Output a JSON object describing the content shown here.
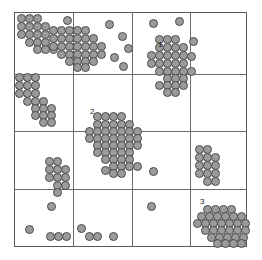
{
  "figure": {
    "kind": "scatter-plot-with-grid",
    "background_color": "#ffffff",
    "border_color": "#5a5a5a",
    "gridline_color": "#6b6b6b",
    "point_fill_color": "#9b9b9b",
    "point_stroke_color": "#4a4a4a",
    "point_diameter_px": 9
  },
  "chart_data": {
    "type": "scatter",
    "title": "",
    "subtitle": "",
    "xlabel": "",
    "ylabel": "",
    "xlim": [
      0,
      100
    ],
    "ylim": [
      0,
      100
    ],
    "xticks": [],
    "yticks": [],
    "xtick_labels": [],
    "ytick_labels": [],
    "grid": true,
    "grid_rows": 4,
    "grid_columns": 4,
    "grid_x_lines": [
      25,
      50,
      75
    ],
    "grid_y_lines": [
      25,
      50,
      75
    ],
    "legend": null,
    "legend_position": "none",
    "series": [
      {
        "name": "points",
        "marker": "circle",
        "fill": "#9b9b9b",
        "stroke": "#4a4a4a",
        "x": [
          9,
          14,
          20,
          9,
          14,
          20,
          26,
          9,
          14,
          20,
          26,
          14,
          20,
          26,
          20,
          26,
          31,
          26,
          31,
          37,
          42,
          48,
          31,
          37,
          42,
          48,
          54,
          31,
          37,
          42,
          48,
          54,
          37,
          42,
          48,
          54,
          42,
          48,
          54,
          37,
          42,
          48,
          58,
          27,
          55,
          62,
          70,
          57,
          65,
          77,
          86,
          8,
          14,
          20,
          8,
          14,
          20,
          8,
          14,
          20,
          14,
          20,
          26,
          20,
          26,
          32,
          20,
          26,
          32,
          26,
          32,
          63,
          69,
          75,
          63,
          69,
          75,
          81,
          63,
          69,
          75,
          81,
          87,
          63,
          69,
          75,
          81,
          87,
          69,
          75,
          81,
          87,
          93,
          75,
          81,
          87,
          69,
          75,
          81,
          87,
          75,
          81,
          93,
          97,
          88,
          97,
          41,
          47,
          53,
          59,
          41,
          47,
          53,
          59,
          65,
          35,
          41,
          47,
          53,
          59,
          65,
          71,
          35,
          41,
          47,
          53,
          59,
          65,
          71,
          41,
          47,
          53,
          59,
          65,
          71,
          41,
          47,
          53,
          59,
          65,
          47,
          53,
          59,
          65,
          53,
          59,
          65,
          71,
          53,
          59,
          47,
          78,
          84,
          78,
          84,
          90,
          78,
          84,
          90,
          78,
          84,
          90,
          84,
          90,
          19,
          25,
          19,
          25,
          31,
          19,
          25,
          31,
          25,
          31,
          25,
          20,
          63,
          5,
          20,
          26,
          32,
          20,
          26,
          42,
          48,
          60,
          42,
          48,
          79,
          85,
          91,
          97,
          73,
          79,
          85,
          91,
          97,
          103,
          67,
          73,
          79,
          85,
          91,
          97,
          103,
          73,
          79,
          85,
          91,
          97,
          103,
          79,
          85,
          91,
          97,
          103,
          85,
          91,
          97,
          103,
          91,
          97,
          103
        ],
        "y": [
          96,
          96,
          96,
          91,
          91,
          91,
          91,
          86,
          86,
          86,
          86,
          81,
          81,
          81,
          76,
          76,
          76,
          89,
          89,
          89,
          89,
          89,
          84,
          84,
          84,
          84,
          84,
          79,
          79,
          79,
          79,
          79,
          74,
          74,
          74,
          74,
          69,
          69,
          69,
          64,
          64,
          64,
          74,
          93,
          94,
          79,
          73,
          68,
          63,
          94,
          88,
          70,
          70,
          70,
          65,
          65,
          65,
          60,
          60,
          60,
          55,
          55,
          55,
          50,
          50,
          50,
          45,
          45,
          45,
          40,
          40,
          88,
          88,
          88,
          83,
          83,
          83,
          83,
          78,
          78,
          78,
          78,
          78,
          73,
          73,
          73,
          73,
          73,
          68,
          68,
          68,
          68,
          68,
          63,
          63,
          63,
          58,
          58,
          58,
          58,
          53,
          53,
          81,
          86,
          78,
          66,
          60,
          60,
          60,
          60,
          55,
          55,
          55,
          55,
          55,
          50,
          50,
          50,
          50,
          50,
          50,
          50,
          45,
          45,
          45,
          45,
          45,
          45,
          45,
          40,
          40,
          40,
          40,
          40,
          40,
          35,
          35,
          35,
          35,
          35,
          30,
          30,
          30,
          30,
          25,
          25,
          25,
          25,
          20,
          20,
          22,
          40,
          40,
          35,
          35,
          35,
          30,
          30,
          30,
          25,
          25,
          25,
          20,
          20,
          30,
          30,
          25,
          25,
          25,
          20,
          20,
          20,
          15,
          15,
          10,
          3,
          27,
          3,
          3,
          3,
          3,
          8,
          8,
          3,
          3,
          5,
          8,
          8,
          17,
          17,
          17,
          17,
          12,
          12,
          12,
          12,
          12,
          12,
          7,
          7,
          7,
          7,
          7,
          7,
          7,
          2,
          2,
          2,
          2,
          2,
          2,
          -2,
          -2,
          -2,
          -2,
          -2,
          -6,
          -6,
          -6,
          -6,
          -10,
          -10,
          -10
        ]
      }
    ],
    "annotations": [
      {
        "text": "1",
        "x": 62,
        "y": 82,
        "label": "cluster-1-label"
      },
      {
        "text": "2",
        "x": 35,
        "y": 57,
        "label": "cluster-2-label"
      },
      {
        "text": "3",
        "x": 78,
        "y": 20,
        "label": "cluster-3-label"
      }
    ]
  },
  "points": {
    "top_left_dense": [
      [
        20,
        17
      ],
      [
        28,
        17
      ],
      [
        36,
        17
      ],
      [
        20,
        25
      ],
      [
        28,
        25
      ],
      [
        36,
        25
      ],
      [
        44,
        25
      ],
      [
        20,
        33
      ],
      [
        28,
        33
      ],
      [
        36,
        33
      ],
      [
        44,
        33
      ],
      [
        28,
        41
      ],
      [
        36,
        41
      ],
      [
        44,
        41
      ],
      [
        36,
        48
      ],
      [
        44,
        48
      ],
      [
        52,
        48
      ]
    ],
    "upper_middle_band": [
      [
        52,
        29
      ],
      [
        60,
        29
      ],
      [
        68,
        29
      ],
      [
        76,
        29
      ],
      [
        84,
        29
      ],
      [
        52,
        37
      ],
      [
        60,
        37
      ],
      [
        68,
        37
      ],
      [
        76,
        37
      ],
      [
        84,
        37
      ],
      [
        92,
        37
      ],
      [
        52,
        45
      ],
      [
        60,
        45
      ],
      [
        68,
        45
      ],
      [
        76,
        45
      ],
      [
        84,
        45
      ],
      [
        92,
        45
      ],
      [
        60,
        53
      ],
      [
        68,
        53
      ],
      [
        76,
        53
      ],
      [
        84,
        53
      ],
      [
        92,
        53
      ],
      [
        68,
        60
      ],
      [
        76,
        60
      ],
      [
        84,
        60
      ],
      [
        92,
        60
      ],
      [
        76,
        66
      ],
      [
        84,
        66
      ],
      [
        100,
        45
      ],
      [
        100,
        53
      ]
    ],
    "scattered_upper": [
      [
        66,
        19
      ],
      [
        108,
        23
      ],
      [
        121,
        35
      ],
      [
        127,
        47
      ],
      [
        113,
        56
      ],
      [
        122,
        65
      ],
      [
        152,
        22
      ],
      [
        178,
        20
      ],
      [
        192,
        40
      ]
    ],
    "left_middle_cluster": [
      [
        18,
        76
      ],
      [
        26,
        76
      ],
      [
        34,
        76
      ],
      [
        18,
        84
      ],
      [
        26,
        84
      ],
      [
        34,
        84
      ],
      [
        18,
        92
      ],
      [
        26,
        92
      ],
      [
        34,
        92
      ],
      [
        26,
        100
      ],
      [
        34,
        100
      ],
      [
        42,
        100
      ],
      [
        34,
        107
      ],
      [
        42,
        107
      ],
      [
        50,
        107
      ],
      [
        34,
        114
      ],
      [
        42,
        114
      ],
      [
        50,
        114
      ],
      [
        42,
        121
      ],
      [
        50,
        121
      ]
    ],
    "cluster1": [
      [
        158,
        38
      ],
      [
        166,
        38
      ],
      [
        174,
        38
      ],
      [
        158,
        46
      ],
      [
        166,
        46
      ],
      [
        174,
        46
      ],
      [
        182,
        46
      ],
      [
        150,
        54
      ],
      [
        158,
        54
      ],
      [
        166,
        54
      ],
      [
        174,
        54
      ],
      [
        182,
        54
      ],
      [
        150,
        62
      ],
      [
        158,
        62
      ],
      [
        166,
        62
      ],
      [
        174,
        62
      ],
      [
        182,
        62
      ],
      [
        158,
        70
      ],
      [
        166,
        70
      ],
      [
        174,
        70
      ],
      [
        182,
        70
      ],
      [
        190,
        70
      ],
      [
        166,
        77
      ],
      [
        174,
        77
      ],
      [
        182,
        77
      ],
      [
        158,
        84
      ],
      [
        166,
        84
      ],
      [
        174,
        84
      ],
      [
        182,
        84
      ],
      [
        166,
        91
      ],
      [
        174,
        91
      ],
      [
        190,
        55
      ]
    ],
    "cluster2": [
      [
        96,
        115
      ],
      [
        104,
        115
      ],
      [
        112,
        115
      ],
      [
        120,
        115
      ],
      [
        96,
        123
      ],
      [
        104,
        123
      ],
      [
        112,
        123
      ],
      [
        120,
        123
      ],
      [
        128,
        123
      ],
      [
        88,
        130
      ],
      [
        96,
        130
      ],
      [
        104,
        130
      ],
      [
        112,
        130
      ],
      [
        120,
        130
      ],
      [
        128,
        130
      ],
      [
        136,
        130
      ],
      [
        88,
        137
      ],
      [
        96,
        137
      ],
      [
        104,
        137
      ],
      [
        112,
        137
      ],
      [
        120,
        137
      ],
      [
        128,
        137
      ],
      [
        136,
        137
      ],
      [
        96,
        144
      ],
      [
        104,
        144
      ],
      [
        112,
        144
      ],
      [
        120,
        144
      ],
      [
        128,
        144
      ],
      [
        136,
        144
      ],
      [
        96,
        151
      ],
      [
        104,
        151
      ],
      [
        112,
        151
      ],
      [
        120,
        151
      ],
      [
        128,
        151
      ],
      [
        104,
        158
      ],
      [
        112,
        158
      ],
      [
        120,
        158
      ],
      [
        128,
        158
      ],
      [
        112,
        165
      ],
      [
        120,
        165
      ],
      [
        128,
        165
      ],
      [
        136,
        165
      ],
      [
        112,
        172
      ],
      [
        120,
        172
      ],
      [
        104,
        169
      ]
    ],
    "right_middle_cluster": [
      [
        198,
        148
      ],
      [
        206,
        148
      ],
      [
        198,
        156
      ],
      [
        206,
        156
      ],
      [
        214,
        156
      ],
      [
        198,
        164
      ],
      [
        206,
        164
      ],
      [
        214,
        164
      ],
      [
        198,
        172
      ],
      [
        206,
        172
      ],
      [
        214,
        172
      ],
      [
        206,
        180
      ],
      [
        214,
        180
      ]
    ],
    "lower_left_cluster": [
      [
        48,
        160
      ],
      [
        56,
        160
      ],
      [
        48,
        168
      ],
      [
        56,
        168
      ],
      [
        64,
        168
      ],
      [
        48,
        176
      ],
      [
        56,
        176
      ],
      [
        64,
        176
      ],
      [
        56,
        184
      ],
      [
        64,
        184
      ],
      [
        56,
        191
      ]
    ],
    "scattered_lower": [
      [
        50,
        205
      ],
      [
        28,
        228
      ],
      [
        49,
        235
      ],
      [
        57,
        235
      ],
      [
        65,
        235
      ],
      [
        80,
        227
      ],
      [
        88,
        235
      ],
      [
        96,
        235
      ],
      [
        112,
        235
      ],
      [
        152,
        170
      ],
      [
        150,
        205
      ]
    ],
    "cluster3": [
      [
        206,
        208
      ],
      [
        214,
        208
      ],
      [
        222,
        208
      ],
      [
        230,
        208
      ],
      [
        200,
        215
      ],
      [
        208,
        215
      ],
      [
        216,
        215
      ],
      [
        224,
        215
      ],
      [
        232,
        215
      ],
      [
        240,
        215
      ],
      [
        196,
        222
      ],
      [
        204,
        222
      ],
      [
        212,
        222
      ],
      [
        220,
        222
      ],
      [
        228,
        222
      ],
      [
        236,
        222
      ],
      [
        244,
        222
      ],
      [
        204,
        229
      ],
      [
        212,
        229
      ],
      [
        220,
        229
      ],
      [
        228,
        229
      ],
      [
        236,
        229
      ],
      [
        244,
        229
      ],
      [
        210,
        236
      ],
      [
        218,
        236
      ],
      [
        226,
        236
      ],
      [
        234,
        236
      ],
      [
        242,
        236
      ],
      [
        216,
        242
      ],
      [
        224,
        242
      ],
      [
        232,
        242
      ],
      [
        240,
        242
      ]
    ]
  },
  "labels": [
    {
      "text": "1",
      "left": 157,
      "top": 40
    },
    {
      "text": "2",
      "left": 89,
      "top": 107
    },
    {
      "text": "3",
      "left": 199,
      "top": 197
    }
  ]
}
